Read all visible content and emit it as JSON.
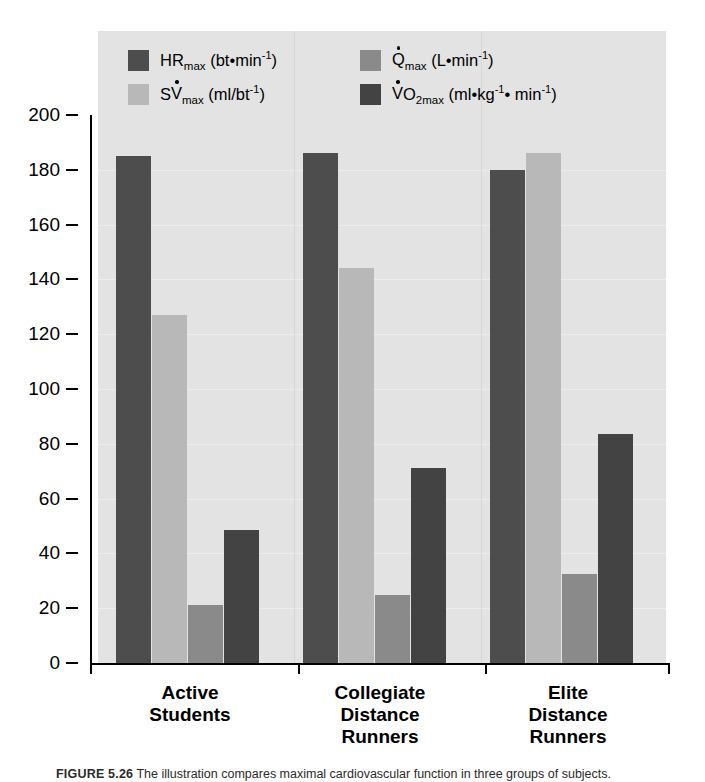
{
  "chart_data": {
    "type": "bar",
    "title": "",
    "xlabel": "",
    "ylabel": "",
    "ylim": [
      0,
      200
    ],
    "yticks": [
      0,
      20,
      40,
      60,
      80,
      100,
      120,
      140,
      160,
      180,
      200
    ],
    "grid": true,
    "legend_position": "top-inside",
    "categories": [
      "Active Students",
      "Collegiate Distance Runners",
      "Elite Distance Runners"
    ],
    "series": [
      {
        "name": "HRmax (bt·min-1)",
        "key": "hrmax",
        "color": "#4d4d4d",
        "values": [
          185,
          186,
          180
        ]
      },
      {
        "name": "SVmax (ml/bt-1)",
        "key": "svmax",
        "color": "#b8b8b8",
        "values": [
          127,
          144,
          186
        ]
      },
      {
        "name": "Qmax (L·min-1)",
        "key": "qmax",
        "color": "#8a8a8a",
        "values": [
          21,
          25,
          32.5
        ]
      },
      {
        "name": "VO2max (ml·kg-1·min-1)",
        "key": "vo2max",
        "color": "#434343",
        "values": [
          48.5,
          71,
          83.5
        ]
      }
    ]
  },
  "legend": [
    {
      "label_main": "HR",
      "label_sub": "max",
      "units": "(bt•min",
      "units_sup": "-1",
      "units_tail": ")",
      "dot_on": "",
      "color": "#4d4d4d"
    },
    {
      "label_main": "Q",
      "label_sub": "max",
      "units": "(L•min",
      "units_sup": "-1",
      "units_tail": ")",
      "dot_on": "Q",
      "color": "#8a8a8a"
    },
    {
      "label_main": "SV",
      "label_sub": "max",
      "units": "(ml/bt",
      "units_sup": "-1",
      "units_tail": ")",
      "dot_on": "V",
      "color": "#b8b8b8"
    },
    {
      "label_main": "VO",
      "label_sub": "2max",
      "units": "(ml•kg",
      "units_sup": "-1",
      "units_tail": "• min",
      "units_sup2": "-1",
      "units_tail2": ")",
      "dot_on": "V",
      "color": "#434343"
    }
  ],
  "legend_text": {
    "hrmax_main": "HR",
    "hrmax_sub": "max",
    "hrmax_units_a": "(bt•min",
    "hrmax_sup": "-1",
    "hrmax_units_b": ")",
    "qmax_main": "Q",
    "qmax_sub": "max",
    "qmax_units_a": "(L•min",
    "qmax_sup": "-1",
    "qmax_units_b": ")",
    "svmax_s": "S",
    "svmax_v": "V",
    "svmax_sub": "max",
    "svmax_units_a": "(ml/bt",
    "svmax_sup": "-1",
    "svmax_units_b": ")",
    "vo2max_v": "V",
    "vo2max_o": "O",
    "vo2max_sub": "2max",
    "vo2max_units_a": "(ml•kg",
    "vo2max_sup": "-1",
    "vo2max_units_b": "• min",
    "vo2max_sup2": "-1",
    "vo2max_units_c": ")"
  },
  "yticks": [
    "200",
    "180",
    "160",
    "140",
    "120",
    "100",
    "80",
    "60",
    "40",
    "20",
    "0"
  ],
  "categories": [
    {
      "lines": [
        "Active",
        "Students"
      ]
    },
    {
      "lines": [
        "Collegiate",
        "Distance",
        "Runners"
      ]
    },
    {
      "lines": [
        "Elite",
        "Distance",
        "Runners"
      ]
    }
  ],
  "caption": {
    "figure_number": "FIGURE 5.26",
    "text": "The illustration compares maximal cardiovascular function in three groups of subjects."
  },
  "colors": {
    "panel_background": "#e3e3e3",
    "gridline": "#ededed",
    "hrmax": "#4d4d4d",
    "svmax": "#b8b8b8",
    "qmax": "#8a8a8a",
    "vo2max": "#434343",
    "axis": "#000000"
  }
}
